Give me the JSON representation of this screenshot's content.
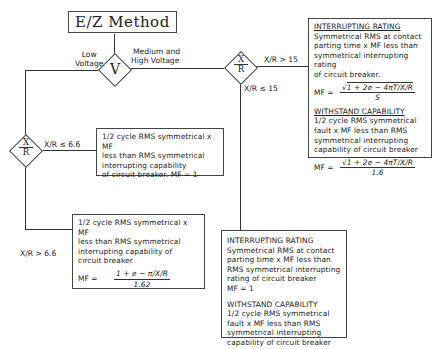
{
  "title": "E/Z Method",
  "decision_v": {
    "symbol": "V",
    "left_label": [
      "Low",
      "Voltage"
    ],
    "right_label": [
      "Medium and",
      "High Voltage"
    ]
  },
  "decision_xr_top": {
    "symbol_num": "X",
    "symbol_den": "R",
    "right_label": "X/R > 15",
    "down_label": "X/R ≤ 15"
  },
  "decision_xr_left": {
    "symbol_num": "X",
    "symbol_den": "R",
    "right_label": "X/R ≤ 6.6",
    "down_label": "X/R > 6.6"
  },
  "box_high_xr": {
    "interrupting_heading": "INTERRUPTING RATING",
    "interrupting_text": [
      "Symmetrical RMS at contact",
      "parting time x MF less than",
      "symmetrical interrupting rating",
      "of circuit breaker."
    ],
    "mf_label": "MF  =",
    "mf_num": "1 + 2e − 4πT/X/R",
    "mf_den": "S",
    "withstand_heading": "WITHSTAND CAPABILITY",
    "withstand_text": [
      "1/2 cycle RMS symmetrical",
      "fault x MF less than RMS",
      "symmetrical interrupting",
      "capability of circuit breaker"
    ],
    "withstand_mf_label": "MF  =",
    "withstand_mf_num": "1 + 2e − 4πT/X/R",
    "withstand_mf_den": "1.6"
  },
  "box_low_xr_small": {
    "text": [
      "1/2 cycle RMS symmetrical x MF",
      "less than RMS symmetrical",
      "interrupting capability",
      "of circuit breaker.   MF = 1"
    ]
  },
  "box_low_xr_large": {
    "text": [
      "1/2 cycle RMS symmetrical x MF",
      "less than RMS symmetrical",
      "interrupting capability of",
      "circuit breaker"
    ],
    "mf_label": "MF  =",
    "mf_num": "1 + e − π/X/R",
    "mf_den": "1.62"
  },
  "box_mid_xr": {
    "interrupting_heading": "INTERRUPTING RATING",
    "interrupting_text": [
      "Symmetrical RMS at contact",
      "parting time x MF less than",
      "RMS symmetrical interrupting",
      "rating of circuit breaker",
      "MF  =  1"
    ],
    "withstand_heading": "WITHSTAND CAPABILITY",
    "withstand_text": [
      "1/2 cycle RMS symmetrical",
      "fault x MF less than RMS",
      "symmetrical interrupting",
      "capability of circuit breaker",
      "MF  =  1"
    ]
  }
}
